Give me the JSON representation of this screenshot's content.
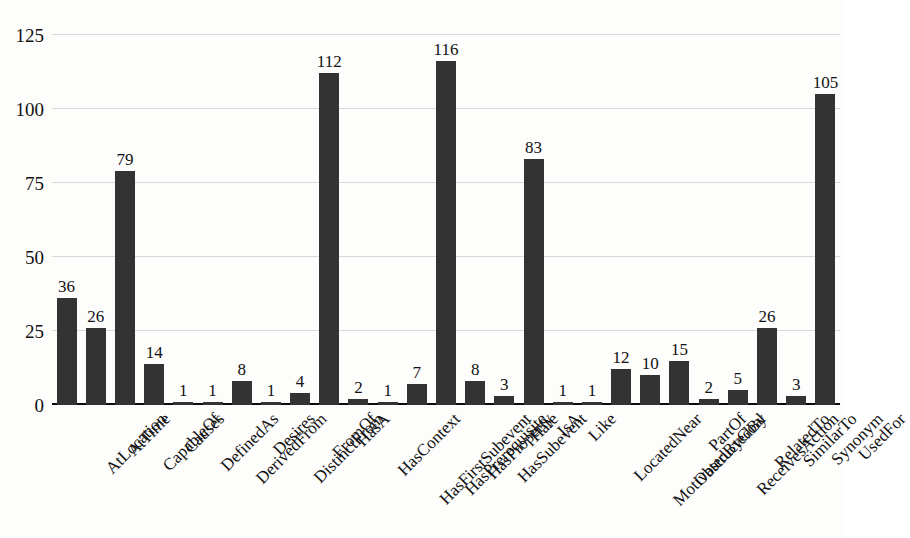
{
  "chart_data": {
    "type": "bar",
    "title": "",
    "subtitle": "",
    "xlabel": "",
    "ylabel": "",
    "ylim": [
      0,
      130
    ],
    "yticks": [
      0,
      25,
      50,
      75,
      100,
      125
    ],
    "grid": true,
    "legend": false,
    "legend_position": "none",
    "bar_color": "#333333",
    "grid_color": "#d8d8d8",
    "axis_color": "#0c0c0c",
    "background_color": "#fdfdfc",
    "label_rotation": -45,
    "show_value_labels": true,
    "categories": [
      "AtLocation",
      "AtTime",
      "CapableOf",
      "Causes",
      "DefinedAs",
      "DerivedFrom",
      "Desires",
      "DistinctFrom",
      "FromOf",
      "HasA",
      "HasContext",
      "HasFirstSubevent",
      "HasPrerequisite",
      "HasProperty",
      "HasSubevent",
      "Hate",
      "IsA",
      "Like",
      "LocatedNear",
      "MotivatedByGoal",
      "ObstructedBy",
      "PartOf",
      "ReceivesAction",
      "RelatedTo",
      "SimilarTo",
      "Synonym",
      "UsedFor"
    ],
    "values": [
      36,
      26,
      79,
      14,
      1,
      1,
      8,
      1,
      4,
      112,
      2,
      1,
      7,
      116,
      8,
      3,
      83,
      1,
      1,
      12,
      10,
      15,
      2,
      5,
      26,
      3,
      105
    ]
  }
}
